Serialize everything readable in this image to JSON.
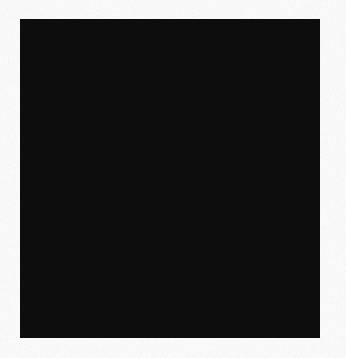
{
  "figure": {
    "kind": "polar-rose-diagram",
    "title": "",
    "caption": "",
    "background_color": "#fefefe",
    "frame": {
      "name": "black-plate-border",
      "fill": "#0d0d0d",
      "x": 20,
      "y": 19,
      "width": 300,
      "height": 319
    },
    "disc": {
      "name": "white-field-disc",
      "fill": "#ffffff",
      "center_x": 174,
      "center_y": 174,
      "radius": 142
    }
  },
  "chart_data": {
    "type": "scatter",
    "title": "",
    "xlabel": "",
    "ylabel": "",
    "grid": true,
    "legend_position": "none",
    "coordinate_system": "polar",
    "center": [
      174,
      174
    ],
    "axis_cross": {
      "name": "crosshair-axes",
      "stroke": "#1a1a1a",
      "stroke_width": 2.6,
      "extent": 133,
      "angles_deg": [
        0,
        90,
        180,
        270
      ]
    },
    "rings": [
      {
        "label": "ring-4",
        "radius": 122,
        "fill": "#dedede",
        "stroke": "#1f1f1f",
        "stroke_width": 2.3
      },
      {
        "label": "ring-3",
        "radius": 93,
        "fill": "#c0c0c0",
        "stroke": "#1f1f1f",
        "stroke_width": 2.3
      },
      {
        "label": "ring-2",
        "radius": 62,
        "fill": "#aaaaaa",
        "stroke": "#1f1f1f",
        "stroke_width": 2.3
      },
      {
        "label": "ring-1",
        "radius": 32,
        "fill": "#9b9b9b",
        "stroke": "#1f1f1f",
        "stroke_width": 2.3
      }
    ],
    "radial_tick_ranges": [
      {
        "label": "outer-band-ticks",
        "r_start": 93,
        "r_end": 122
      },
      {
        "label": "mid-band-ticks",
        "r_start": 62,
        "r_end": 93
      }
    ],
    "band_tick_angles_deg": [
      22,
      50,
      68,
      105,
      128,
      152,
      200,
      232,
      258,
      288,
      310,
      338
    ],
    "spokes": [
      {
        "angle_deg": 88,
        "r": 126
      },
      {
        "angle_deg": 84,
        "r": 119
      },
      {
        "angle_deg": 80,
        "r": 113
      },
      {
        "angle_deg": 77,
        "r": 106
      },
      {
        "angle_deg": 74,
        "r": 99
      },
      {
        "angle_deg": 71,
        "r": 90
      },
      {
        "angle_deg": 68,
        "r": 78
      },
      {
        "angle_deg": 65,
        "r": 68
      },
      {
        "angle_deg": 62,
        "r": 61
      },
      {
        "angle_deg": 59,
        "r": 55
      },
      {
        "angle_deg": 96,
        "r": 124
      },
      {
        "angle_deg": 100,
        "r": 117
      },
      {
        "angle_deg": 104,
        "r": 108
      },
      {
        "angle_deg": 108,
        "r": 96
      },
      {
        "angle_deg": 113,
        "r": 83
      },
      {
        "angle_deg": 118,
        "r": 70
      },
      {
        "angle_deg": 122,
        "r": 52
      },
      {
        "angle_deg": 130,
        "r": 40
      },
      {
        "angle_deg": 138,
        "r": 34
      },
      {
        "angle_deg": 168,
        "r": 117
      },
      {
        "angle_deg": 176,
        "r": 96
      },
      {
        "angle_deg": 185,
        "r": 118
      },
      {
        "angle_deg": 190,
        "r": 78
      },
      {
        "angle_deg": 196,
        "r": 96
      },
      {
        "angle_deg": 203,
        "r": 104
      },
      {
        "angle_deg": 210,
        "r": 56
      },
      {
        "angle_deg": 218,
        "r": 72
      },
      {
        "angle_deg": 226,
        "r": 66
      },
      {
        "angle_deg": 234,
        "r": 108
      },
      {
        "angle_deg": 240,
        "r": 50
      },
      {
        "angle_deg": 248,
        "r": 62
      },
      {
        "angle_deg": 252,
        "r": 78
      },
      {
        "angle_deg": 256,
        "r": 96
      },
      {
        "angle_deg": 260,
        "r": 112
      },
      {
        "angle_deg": 264,
        "r": 121
      },
      {
        "angle_deg": 268,
        "r": 128
      },
      {
        "angle_deg": 272,
        "r": 120
      },
      {
        "angle_deg": 276,
        "r": 108
      },
      {
        "angle_deg": 280,
        "r": 92
      },
      {
        "angle_deg": 285,
        "r": 80
      },
      {
        "angle_deg": 292,
        "r": 70
      },
      {
        "angle_deg": 300,
        "r": 60
      },
      {
        "angle_deg": 308,
        "r": 48
      },
      {
        "angle_deg": 318,
        "r": 40
      },
      {
        "angle_deg": 330,
        "r": 52
      },
      {
        "angle_deg": 342,
        "r": 70
      },
      {
        "angle_deg": 352,
        "r": 88
      },
      {
        "angle_deg": 8,
        "r": 94
      },
      {
        "angle_deg": 14,
        "r": 112
      },
      {
        "angle_deg": 20,
        "r": 86
      },
      {
        "angle_deg": 28,
        "r": 60
      },
      {
        "angle_deg": 36,
        "r": 48
      },
      {
        "angle_deg": 44,
        "r": 44
      },
      {
        "angle_deg": 52,
        "r": 46
      }
    ],
    "spoke_style": {
      "stroke": "#1a1a1a",
      "stroke_width": 1.7
    }
  }
}
